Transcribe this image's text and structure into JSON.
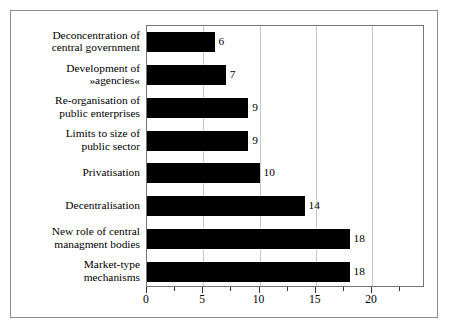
{
  "chart_data": {
    "type": "bar",
    "orientation": "horizontal",
    "title": "",
    "subtitle": "",
    "xlabel": "",
    "ylabel": "",
    "xlim": [
      0,
      24.7
    ],
    "ylim": null,
    "grid": "vertical gridlines at major ticks 5, 10, 15, 20",
    "legend": "none",
    "bar_color": "#000000",
    "gridline_color": "#c9c9c9",
    "frame_color": "#757575",
    "background_color": "#ffffff",
    "xticks": [
      0,
      5,
      10,
      15,
      20
    ],
    "xtick_labels": [
      "0",
      "5",
      "10",
      "15",
      "20"
    ],
    "xticks_minor": [
      2.5,
      7.5,
      12.5,
      17.5,
      22.5
    ],
    "categories": [
      "Deconcentration of\ncentral government",
      "Development of\n»agencies«",
      "Re-organisation of\npublic enterprises",
      "Limits to size of\npublic sector",
      "Privatisation",
      "Decentralisation",
      "New role of central\nmanagment bodies",
      "Market-type\nmechanisms"
    ],
    "values": [
      6,
      7,
      9,
      9,
      10,
      14,
      18,
      18
    ],
    "data_labels": [
      "6",
      "7",
      "9",
      "9",
      "10",
      "14",
      "18",
      "18"
    ],
    "series": [
      {
        "name": "",
        "values": [
          6,
          7,
          9,
          9,
          10,
          14,
          18,
          18
        ]
      }
    ]
  }
}
